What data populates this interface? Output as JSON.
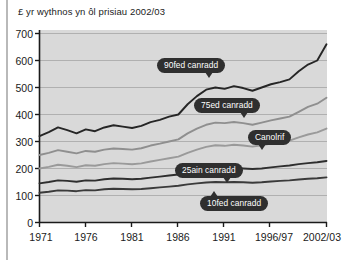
{
  "chart_data": {
    "type": "line",
    "title": "£ yr wythnos yn ôl prisiau 2002/03",
    "xlabel": "",
    "ylabel": "",
    "ylim": [
      0,
      700
    ],
    "yticks": [
      0,
      100,
      200,
      300,
      400,
      500,
      600,
      700
    ],
    "ytick_labels": [
      "0",
      "100",
      "200",
      "300",
      "400",
      "500",
      "600",
      "700"
    ],
    "grid": true,
    "legend": "inline-callouts",
    "categories": [
      "1971",
      "1972",
      "1973",
      "1974",
      "1975",
      "1976",
      "1977",
      "1978",
      "1979",
      "1980",
      "1981",
      "1982",
      "1983",
      "1984",
      "1985",
      "1986",
      "1987",
      "1988",
      "1989",
      "1990",
      "1991",
      "1992",
      "1993",
      "1994/95",
      "1995/96",
      "1996/97",
      "1997/98",
      "1998/99",
      "1999/00",
      "2000/01",
      "2001/02",
      "2002/03"
    ],
    "xtick_labels": [
      "1971",
      "1976",
      "1981",
      "1986",
      "1991",
      "1996/97",
      "2002/03"
    ],
    "xtick_positions": [
      0,
      5,
      10,
      15,
      20,
      25,
      31
    ],
    "series": [
      {
        "name": "90fed canradd",
        "color": "#262626",
        "values": [
          320,
          335,
          352,
          342,
          330,
          345,
          338,
          352,
          360,
          355,
          350,
          358,
          372,
          380,
          392,
          400,
          438,
          468,
          492,
          500,
          495,
          505,
          498,
          488,
          500,
          512,
          520,
          530,
          560,
          585,
          600,
          660
        ]
      },
      {
        "name": "75ed canradd",
        "color": "#8f8f8f",
        "values": [
          250,
          258,
          268,
          262,
          256,
          265,
          262,
          270,
          274,
          272,
          270,
          275,
          285,
          292,
          300,
          308,
          330,
          348,
          362,
          370,
          368,
          372,
          368,
          362,
          370,
          378,
          385,
          392,
          410,
          428,
          440,
          462
        ]
      },
      {
        "name": "Canolrif",
        "color": "#9a9a9a",
        "values": [
          200,
          206,
          214,
          210,
          205,
          212,
          210,
          216,
          220,
          218,
          216,
          219,
          226,
          232,
          238,
          244,
          258,
          270,
          280,
          286,
          284,
          288,
          285,
          281,
          286,
          292,
          298,
          303,
          315,
          326,
          334,
          348
        ]
      },
      {
        "name": "25ain canradd",
        "color": "#2e2e2e",
        "values": [
          145,
          150,
          156,
          154,
          151,
          156,
          155,
          160,
          163,
          162,
          160,
          162,
          166,
          170,
          174,
          178,
          186,
          192,
          198,
          202,
          200,
          202,
          200,
          198,
          200,
          204,
          208,
          211,
          216,
          220,
          223,
          228
        ]
      },
      {
        "name": "10fed canradd",
        "color": "#3a3a3a",
        "values": [
          110,
          114,
          119,
          118,
          116,
          120,
          119,
          123,
          125,
          124,
          123,
          124,
          127,
          130,
          133,
          136,
          141,
          145,
          148,
          150,
          149,
          150,
          149,
          147,
          149,
          152,
          154,
          156,
          159,
          162,
          164,
          167
        ]
      }
    ]
  },
  "plot": {
    "background": "#d9d9d9",
    "gridline_color": "#b0b0b0",
    "axis_color": "#1a1a1a"
  },
  "labels": {
    "p90": "90fed canradd",
    "p75": "75ed canradd",
    "median": "Canolrif",
    "p25": "25ain canradd",
    "p10": "10fed canradd"
  }
}
